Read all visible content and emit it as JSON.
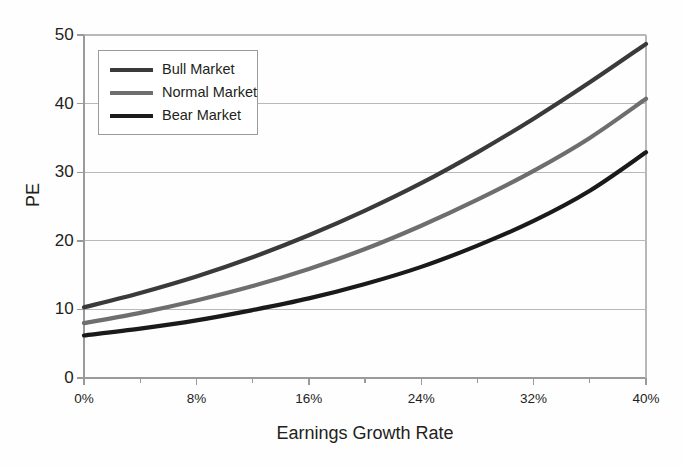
{
  "chart_data": {
    "type": "line",
    "title": "",
    "subtitle": "",
    "xlabel": "Earnings Growth Rate",
    "ylabel": "PE",
    "xlim": [
      0,
      40
    ],
    "ylim": [
      0,
      50
    ],
    "grid": true,
    "grid_axis": "y",
    "legend_position": "upper-left-inside",
    "x_tick_labels": [
      "0%",
      "8%",
      "16%",
      "24%",
      "32%",
      "40%"
    ],
    "x_tick_values": [
      0,
      8,
      16,
      24,
      32,
      40
    ],
    "x_minor_tick_values": [
      4,
      12,
      20,
      28,
      36
    ],
    "y_tick_labels": [
      "0",
      "10",
      "20",
      "30",
      "40",
      "50"
    ],
    "y_tick_values": [
      0,
      10,
      20,
      30,
      40,
      50
    ],
    "x": [
      0,
      4,
      8,
      12,
      16,
      20,
      24,
      28,
      32,
      36,
      40
    ],
    "series": [
      {
        "name": "Bull Market",
        "color": "#3a3a3a",
        "values": [
          10.3,
          12.4,
          14.8,
          17.6,
          20.8,
          24.4,
          28.4,
          32.9,
          37.8,
          43.1,
          48.7
        ]
      },
      {
        "name": "Normal Market",
        "color": "#6e6e6e",
        "values": [
          8.0,
          9.5,
          11.3,
          13.4,
          15.9,
          18.8,
          22.2,
          26.0,
          30.2,
          35.0,
          40.7
        ]
      },
      {
        "name": "Bear Market",
        "color": "#1a1a1a",
        "values": [
          6.2,
          7.2,
          8.4,
          9.9,
          11.6,
          13.7,
          16.2,
          19.3,
          22.9,
          27.3,
          32.9
        ]
      }
    ]
  },
  "axes": {
    "x_title": "Earnings Growth Rate",
    "y_title": "PE"
  },
  "legend": {
    "items": [
      {
        "label": "Bull Market",
        "color": "#3a3a3a"
      },
      {
        "label": "Normal Market",
        "color": "#6e6e6e"
      },
      {
        "label": "Bear Market",
        "color": "#1a1a1a"
      }
    ]
  },
  "colors": {
    "background": "#fefefe",
    "grid": "#b8b8b8",
    "axis": "#9a9a9a",
    "text": "#231f20",
    "bull": "#3a3a3a",
    "normal": "#6e6e6e",
    "bear": "#1a1a1a"
  }
}
